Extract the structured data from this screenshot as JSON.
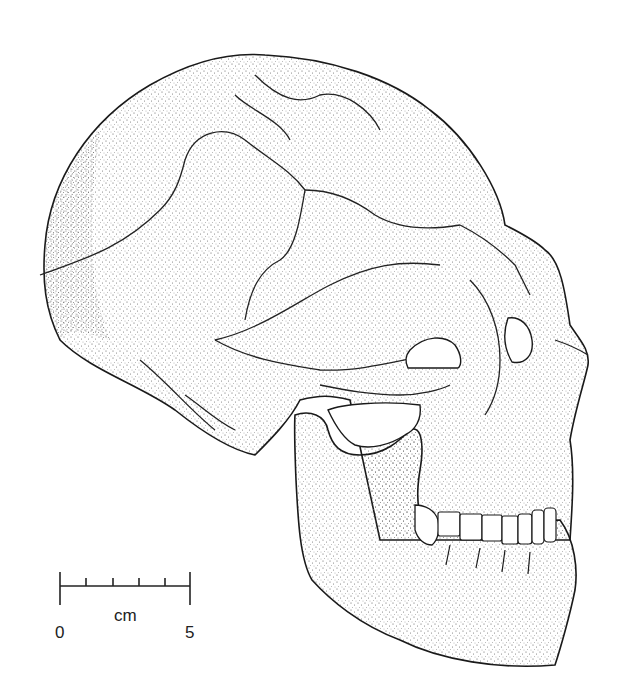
{
  "figure": {
    "colors": {
      "ink": "#1a1a1a",
      "paper": "#ffffff",
      "stipple": "#555555"
    }
  },
  "scale_bar": {
    "start_label": "0",
    "end_label": "5",
    "unit_label": "cm",
    "tick_count": 6
  }
}
